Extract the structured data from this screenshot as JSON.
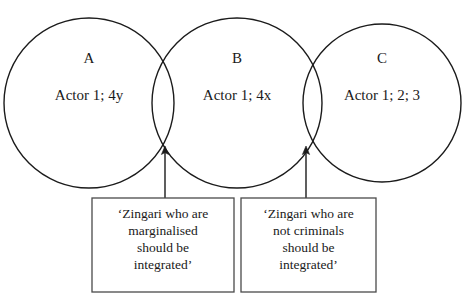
{
  "diagram": {
    "type": "overlapping-circles-with-callouts",
    "circles": [
      {
        "id": "A",
        "label": "A",
        "content": "Actor 1; 4y",
        "cx": 89,
        "cy": 103,
        "r": 85
      },
      {
        "id": "B",
        "label": "B",
        "content": "Actor 1; 4x",
        "cx": 237,
        "cy": 103,
        "r": 85
      },
      {
        "id": "C",
        "label": "C",
        "content": "Actor 1; 2; 3",
        "cx": 382,
        "cy": 103,
        "r": 79
      }
    ],
    "callouts": [
      {
        "id": "callout-left",
        "lines": [
          "‘Zingari who are",
          "marginalised",
          "should be",
          "integrated’"
        ],
        "x": 92,
        "y": 198,
        "width": 142,
        "height": 94,
        "anchor_x": 165,
        "anchor_y": 147
      },
      {
        "id": "callout-right",
        "lines": [
          "‘Zingari who are",
          "not criminals",
          "should be",
          "integrated’"
        ],
        "x": 241,
        "y": 198,
        "width": 135,
        "height": 94,
        "anchor_x": 306,
        "anchor_y": 147
      }
    ],
    "colors": {
      "background": "#ffffff",
      "stroke": "#1b1b1b",
      "box_stroke": "#4a4a4a",
      "text": "#1a1a1a"
    }
  }
}
